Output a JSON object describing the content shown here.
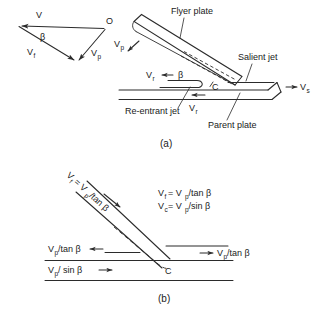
{
  "figure": {
    "caption_a": "(a)",
    "caption_b": "(b)"
  },
  "velocity_triangle": {
    "label_v": "V",
    "label_beta": "β",
    "label_vf": "V",
    "label_vf_sub": "f",
    "label_vp": "V",
    "label_vp_sub": "p",
    "label_o": "O"
  },
  "diagram_a": {
    "flyer_plate": "Flyer plate",
    "salient_jet": "Salient jet",
    "reentrant_jet": "Re-entrant jet",
    "parent_plate": "Parent plate",
    "collision_point": "C",
    "beta": "β",
    "vp": "V",
    "vp_sub": "p",
    "vr_left": "V",
    "vr_left_sub": "r",
    "vr_bottom": "V",
    "vr_bottom_sub": "r",
    "vs": "V",
    "vs_sub": "s"
  },
  "diagram_b": {
    "inclined_label_main": "V",
    "inclined_label_sub": "f",
    "inclined_label_rest": " = V",
    "inclined_label_sub2": "p",
    "inclined_label_tail": "/tan β",
    "equation_1_lhs": "V",
    "equation_1_lhs_sub": "f",
    "equation_1_rhs": " = V",
    "equation_1_rhs_sub": "p",
    "equation_1_tail": "/tan β",
    "equation_2_lhs": "V",
    "equation_2_lhs_sub": "c",
    "equation_2_rhs": " = V",
    "equation_2_rhs_sub": "p",
    "equation_2_tail": " /sin β",
    "left_upper": "V",
    "left_upper_sub": "p",
    "left_upper_tail": " /tan β",
    "left_lower": "V",
    "left_lower_sub": "p",
    "left_lower_tail": " / sin β",
    "right_label": "V",
    "right_label_sub": "p",
    "right_label_tail": "/tan β",
    "collision_point": "C"
  },
  "colors": {
    "ink": "#2b2b2b",
    "background": "#ffffff"
  }
}
